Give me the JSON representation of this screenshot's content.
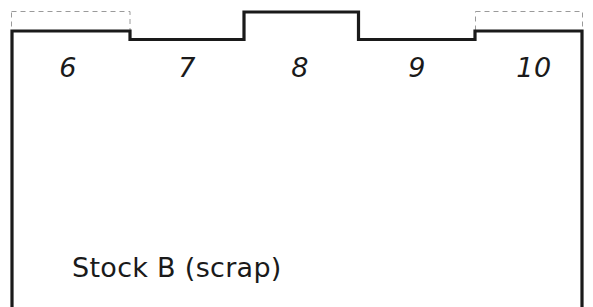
{
  "figure": {
    "type": "cutting-stock-profile-diagram",
    "background_color": "#ffffff",
    "stroke_color": "#1a1a1a",
    "dashed_color": "#9a9a9a",
    "width": 593,
    "height": 307
  },
  "stock": {
    "label": "Stock B (scrap)",
    "label_x": 72,
    "label_y": 252
  },
  "columns": [
    {
      "id": "col-6",
      "label": "6",
      "center_x": 68,
      "label_y": 52,
      "level": "low",
      "start_x": 11,
      "end_x": 130
    },
    {
      "id": "col-7",
      "label": "7",
      "center_x": 187,
      "label_y": 52,
      "level": "high",
      "start_x": 130,
      "end_x": 244
    },
    {
      "id": "col-8",
      "label": "8",
      "center_x": 300,
      "label_y": 52,
      "level": "low",
      "start_x": 244,
      "end_x": 359
    },
    {
      "id": "col-9",
      "label": "9",
      "center_x": 417,
      "label_y": 52,
      "level": "high",
      "start_x": 359,
      "end_x": 475
    },
    {
      "id": "col-10",
      "label": "10",
      "center_x": 534,
      "label_y": 52,
      "level": "low",
      "start_x": 475,
      "end_x": 583
    }
  ],
  "geometry": {
    "left_x": 11,
    "right_x": 583,
    "bottom_y": 307,
    "top_raised_y": 12,
    "top_lowered_y": 39,
    "solid_outline_points": "11,307 11,31 130,31 130,39 244,39 244,12 359,12 359,39 475,39 475,31 583,31 583,307",
    "dashed_regions": [
      {
        "id": "dashed-left",
        "x": 11,
        "y": 11,
        "width": 119,
        "height": 20
      },
      {
        "id": "dashed-right",
        "x": 475,
        "y": 11,
        "width": 108,
        "height": 20
      }
    ]
  }
}
